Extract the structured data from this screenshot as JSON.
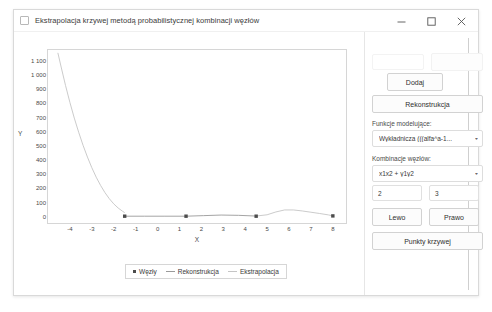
{
  "window": {
    "title": "Ekstrapolacja krzywej metodą probabilistycznej kombinacji węzłów",
    "icon": "app-icon",
    "controls": {
      "minimize": "minimize-icon",
      "maximize": "maximize-icon",
      "close": "close-icon"
    }
  },
  "panel": {
    "ghost_field_value": "",
    "ghost_button_label": "",
    "add_button": "Dodaj",
    "reconstruct_button": "Rekonstrukcja",
    "model_functions_label": "Funkcje modelujące:",
    "model_functions_value": "Wykładnicza (((alfa^a-1...",
    "node_combinations_label": "Kombinacje węzłów:",
    "node_combinations_value": "x1x2 + y1y2",
    "param_a": "2",
    "param_b": "3",
    "left_button": "Lewo",
    "right_button": "Prawo",
    "curve_points_button": "Punkty krzywej",
    "caret": "▾"
  },
  "chart_data": {
    "type": "line",
    "title": "",
    "xlabel": "X",
    "ylabel": "Y",
    "xlim": [
      -5,
      8.6
    ],
    "ylim": [
      -40,
      1180
    ],
    "grid": false,
    "legend_position": "bottom",
    "y_ticks": [
      "1 100",
      "1 000",
      "900",
      "800",
      "700",
      "600",
      "500",
      "400",
      "300",
      "200",
      "100",
      "0"
    ],
    "y_tick_values": [
      1100,
      1000,
      900,
      800,
      700,
      600,
      500,
      400,
      300,
      200,
      100,
      0
    ],
    "x_ticks": [
      "-4",
      "-3",
      "-2",
      "-1",
      "0",
      "1",
      "2",
      "3",
      "4",
      "5",
      "6",
      "7",
      "8"
    ],
    "x_tick_values": [
      -4,
      -3,
      -2,
      -1,
      0,
      1,
      2,
      3,
      4,
      5,
      6,
      7,
      8
    ],
    "series": [
      {
        "name": "Węzły",
        "type": "scatter",
        "color": "#4c4c4c",
        "points": [
          {
            "x": -1.5,
            "y": 8
          },
          {
            "x": 1.3,
            "y": 8
          },
          {
            "x": 4.5,
            "y": 8
          },
          {
            "x": 8.0,
            "y": 10
          }
        ]
      },
      {
        "name": "Rekonstrukcja",
        "type": "line",
        "color": "#9a9a9a",
        "points": [
          {
            "x": -1.5,
            "y": 8
          },
          {
            "x": -0.6,
            "y": 8
          },
          {
            "x": 0.3,
            "y": 8
          },
          {
            "x": 1.3,
            "y": 8
          },
          {
            "x": 2.1,
            "y": 12
          },
          {
            "x": 2.9,
            "y": 16
          },
          {
            "x": 3.7,
            "y": 14
          },
          {
            "x": 4.5,
            "y": 9
          }
        ]
      },
      {
        "name": "Ekstrapolacja",
        "type": "line",
        "color": "#c5c5c5",
        "points": [
          {
            "x": -4.55,
            "y": 1160
          },
          {
            "x": -4.4,
            "y": 1060
          },
          {
            "x": -4.2,
            "y": 930
          },
          {
            "x": -4.0,
            "y": 810
          },
          {
            "x": -3.8,
            "y": 700
          },
          {
            "x": -3.6,
            "y": 600
          },
          {
            "x": -3.4,
            "y": 508
          },
          {
            "x": -3.2,
            "y": 425
          },
          {
            "x": -3.0,
            "y": 350
          },
          {
            "x": -2.8,
            "y": 283
          },
          {
            "x": -2.6,
            "y": 225
          },
          {
            "x": -2.4,
            "y": 174
          },
          {
            "x": -2.2,
            "y": 131
          },
          {
            "x": -2.0,
            "y": 95
          },
          {
            "x": -1.8,
            "y": 66
          },
          {
            "x": -1.6,
            "y": 43
          },
          {
            "x": -1.5,
            "y": 33
          },
          {
            "x": 4.5,
            "y": 9
          },
          {
            "x": 5.0,
            "y": 18
          },
          {
            "x": 5.4,
            "y": 38
          },
          {
            "x": 5.8,
            "y": 52
          },
          {
            "x": 6.2,
            "y": 52
          },
          {
            "x": 6.6,
            "y": 45
          },
          {
            "x": 7.0,
            "y": 36
          },
          {
            "x": 7.4,
            "y": 27
          },
          {
            "x": 7.8,
            "y": 17
          },
          {
            "x": 8.0,
            "y": 10
          }
        ]
      }
    ],
    "legend": [
      "Węzły",
      "Rekonstrukcja",
      "Ekstrapolacja"
    ]
  }
}
